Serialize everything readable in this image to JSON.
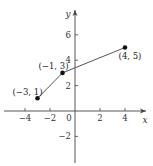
{
  "chart_data": {
    "type": "line",
    "title": "",
    "xlabel": "x",
    "ylabel": "y",
    "xlim": [
      -5.5,
      5.5
    ],
    "ylim": [
      -4,
      8
    ],
    "grid": false,
    "x_ticks": [
      -4,
      -2,
      0,
      2,
      4
    ],
    "x_tick_labels": [
      "−4",
      "−2",
      "0",
      "2",
      "4"
    ],
    "y_ticks": [
      6,
      4,
      2,
      -2
    ],
    "y_tick_labels": [
      "6",
      "4",
      "2",
      "−2"
    ],
    "series": [
      {
        "name": "piecewise linear",
        "points": [
          {
            "x": -3,
            "y": 1,
            "label": "(−3, 1)"
          },
          {
            "x": -1,
            "y": 3,
            "label": "(−1, 3)"
          },
          {
            "x": 4,
            "y": 5,
            "label": "(4, 5)"
          }
        ]
      }
    ],
    "annotations": [
      "(−3, 1)",
      "(−1, 3)",
      "(4, 5)"
    ]
  }
}
